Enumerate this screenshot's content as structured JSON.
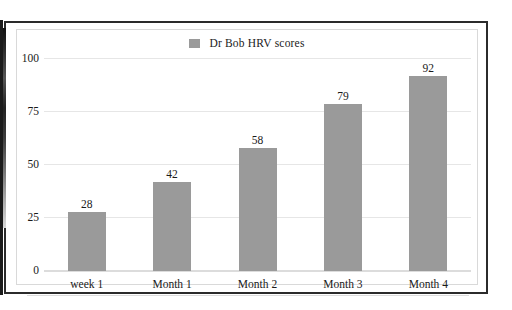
{
  "chart_data": {
    "type": "bar",
    "title": "",
    "subtitle": "",
    "xlabel": "",
    "ylabel": "",
    "categories": [
      "week 1",
      "Month 1",
      "Month 2",
      "Month 3",
      "Month 4"
    ],
    "values": [
      28,
      42,
      58,
      79,
      92
    ],
    "series": [
      {
        "name": "Dr Bob HRV scores",
        "values": [
          28,
          42,
          58,
          79,
          92
        ],
        "color": "#9a9a9a"
      }
    ],
    "ylim": [
      0,
      100
    ],
    "yticks": [
      0,
      25,
      50,
      75,
      100
    ],
    "ytick_labels": [
      "0",
      "25",
      "50",
      "75",
      "100"
    ],
    "grid": true,
    "grid_axis": "y",
    "legend": {
      "position": "top-center",
      "entries": [
        {
          "label": "Dr Bob HRV scores",
          "swatch_name": "legend-swatch-hrv",
          "color": "#9a9a9a"
        }
      ]
    },
    "data_labels_shown": true,
    "data_labels": [
      "28",
      "42",
      "58",
      "79",
      "92"
    ],
    "colors": {
      "bar": "#9a9a9a",
      "gridline": "#e6e6e6",
      "text": "#1a1a1a",
      "frame": "#2b2b2b",
      "panel_border": "#d9d9d9",
      "background": "#ffffff"
    }
  }
}
